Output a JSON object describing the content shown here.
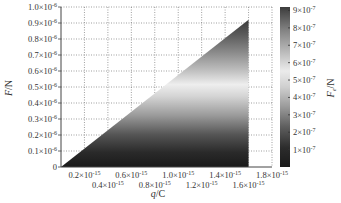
{
  "chart_data": {
    "type": "heatmap",
    "title": "",
    "xlabel": "q/C",
    "ylabel": "F/N",
    "colorbar_label": "F_e/N",
    "xlim": [
      0,
      1.8e-15
    ],
    "ylim": [
      0,
      1e-06
    ],
    "grid": true,
    "grid_style": "dotted",
    "colormap": "grayscale (dark at 0, light near 5.5e-7, dark again at 9e-7)",
    "colorbar_range": [
      0,
      9.2e-07
    ],
    "x_ticks": [
      {
        "value": 2e-16,
        "label": "0.2×10",
        "exp": "-15",
        "row": 1
      },
      {
        "value": 4e-16,
        "label": "0.4×10",
        "exp": "-15",
        "row": 2
      },
      {
        "value": 6e-16,
        "label": "0.6×10",
        "exp": "-15",
        "row": 1
      },
      {
        "value": 8e-16,
        "label": "0.8×10",
        "exp": "-15",
        "row": 2
      },
      {
        "value": 1e-15,
        "label": "1.0×10",
        "exp": "-15",
        "row": 1
      },
      {
        "value": 1.2e-15,
        "label": "1.2×10",
        "exp": "-15",
        "row": 2
      },
      {
        "value": 1.4e-15,
        "label": "1.4×10",
        "exp": "-15",
        "row": 1
      },
      {
        "value": 1.6e-15,
        "label": "1.6×10",
        "exp": "-15",
        "row": 2
      },
      {
        "value": 1.8e-15,
        "label": "1.8×10",
        "exp": "-15",
        "row": 1
      }
    ],
    "y_ticks": [
      {
        "value": 0,
        "label": "0",
        "exp": ""
      },
      {
        "value": 1e-07,
        "label": "0.1×10",
        "exp": "-6"
      },
      {
        "value": 2e-07,
        "label": "0.2×10",
        "exp": "-6"
      },
      {
        "value": 3e-07,
        "label": "0.3×10",
        "exp": "-6"
      },
      {
        "value": 4e-07,
        "label": "0.4×10",
        "exp": "-6"
      },
      {
        "value": 5e-07,
        "label": "0.5×10",
        "exp": "-6"
      },
      {
        "value": 6e-07,
        "label": "0.6×10",
        "exp": "-6"
      },
      {
        "value": 7e-07,
        "label": "0.7×10",
        "exp": "-6"
      },
      {
        "value": 8e-07,
        "label": "0.8×10",
        "exp": "-6"
      },
      {
        "value": 9e-07,
        "label": "0.9×10",
        "exp": "-6"
      },
      {
        "value": 1e-06,
        "label": "1.0×10",
        "exp": "-6"
      }
    ],
    "colorbar_ticks": [
      {
        "value": 1e-07,
        "label": "1×10",
        "exp": "-7"
      },
      {
        "value": 2e-07,
        "label": "2×10",
        "exp": "-7"
      },
      {
        "value": 3e-07,
        "label": "3×10",
        "exp": "-7"
      },
      {
        "value": 4e-07,
        "label": "4×10",
        "exp": "-7"
      },
      {
        "value": 5e-07,
        "label": "5×10",
        "exp": "-7"
      },
      {
        "value": 6e-07,
        "label": "6×10",
        "exp": "-7"
      },
      {
        "value": 7e-07,
        "label": "7×10",
        "exp": "-7"
      },
      {
        "value": 8e-07,
        "label": "8×10",
        "exp": "-7"
      },
      {
        "value": 9e-07,
        "label": "9×10",
        "exp": "-7"
      }
    ],
    "filled_region": {
      "shape": "triangle",
      "vertices": [
        [
          0,
          0
        ],
        [
          1.6e-15,
          9.2e-07
        ],
        [
          1.6e-15,
          0
        ]
      ],
      "description": "Valid region F <= k*q, color varies with F (vertical gradient)"
    }
  },
  "labels": {
    "xlabel_main": "q",
    "xlabel_unit": "/C",
    "ylabel_main": "F",
    "ylabel_unit": "/N",
    "cbar_main": "F",
    "cbar_sub": "e",
    "cbar_unit": "/N"
  }
}
